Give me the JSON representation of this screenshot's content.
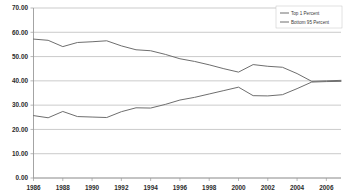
{
  "chart_data": {
    "type": "line",
    "title": "",
    "xlabel": "",
    "ylabel": "",
    "xlim": [
      1986,
      2007
    ],
    "ylim": [
      0,
      70
    ],
    "y_ticks": [
      "0.00",
      "10.00",
      "20.00",
      "30.00",
      "40.00",
      "50.00",
      "60.00",
      "70.00"
    ],
    "y_tick_values": [
      0,
      10,
      20,
      30,
      40,
      50,
      60,
      70
    ],
    "x_ticks": [
      "1986",
      "1988",
      "1990",
      "1992",
      "1994",
      "1996",
      "1998",
      "2000",
      "2002",
      "2004",
      "2006"
    ],
    "x_tick_values": [
      1986,
      1988,
      1990,
      1992,
      1994,
      1996,
      1998,
      2000,
      2002,
      2004,
      2006
    ],
    "x": [
      1986,
      1987,
      1988,
      1989,
      1990,
      1991,
      1992,
      1993,
      1994,
      1995,
      1996,
      1997,
      1998,
      1999,
      2000,
      2001,
      2002,
      2003,
      2004,
      2005,
      2006,
      2007
    ],
    "grid": true,
    "grid_axis": "y",
    "legend_position": "top-right",
    "series": [
      {
        "name": "Top 1 Percent",
        "color": "#6e6e6e",
        "values": [
          57.2,
          56.7,
          54.1,
          55.8,
          56.1,
          56.5,
          54.4,
          52.8,
          52.4,
          50.9,
          49.1,
          48.0,
          46.6,
          45.0,
          43.6,
          46.7,
          46.0,
          45.6,
          43.0,
          39.8,
          40.0,
          40.2
        ]
      },
      {
        "name": "Bottom 95 Percent",
        "color": "#6e6e6e",
        "values": [
          25.7,
          24.8,
          27.4,
          25.3,
          25.1,
          24.9,
          27.3,
          28.9,
          28.8,
          30.3,
          32.1,
          33.2,
          34.6,
          36.0,
          37.4,
          33.9,
          33.8,
          34.3,
          36.8,
          39.5,
          39.7,
          39.8
        ]
      }
    ]
  },
  "legend": {
    "entries": [
      {
        "label": "Top 1 Percent"
      },
      {
        "label": "Bottom 95 Percent"
      }
    ]
  }
}
